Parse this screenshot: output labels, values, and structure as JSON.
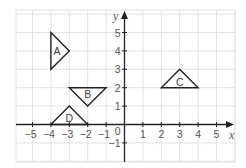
{
  "diagram": {
    "type": "coordinate-grid",
    "x_axis": {
      "label": "x",
      "min": -5,
      "max": 5,
      "ticks": [
        "−5",
        "−4",
        "−3",
        "−2",
        "−1",
        "1",
        "2",
        "3",
        "4",
        "5"
      ]
    },
    "y_axis": {
      "label": "y",
      "min": -1,
      "max": 5,
      "ticks": [
        "5",
        "4",
        "3",
        "2",
        "1",
        "−1"
      ]
    },
    "origin_label": "0",
    "shapes": [
      {
        "name": "A",
        "vertices": [
          [
            -4,
            5
          ],
          [
            -4,
            3
          ],
          [
            -3,
            4
          ]
        ]
      },
      {
        "name": "B",
        "vertices": [
          [
            -3,
            2
          ],
          [
            -1,
            2
          ],
          [
            -2,
            1
          ]
        ]
      },
      {
        "name": "C",
        "vertices": [
          [
            2,
            2
          ],
          [
            4,
            2
          ],
          [
            3,
            3
          ]
        ]
      },
      {
        "name": "D",
        "vertices": [
          [
            -4,
            0
          ],
          [
            -2,
            0
          ],
          [
            -3,
            1
          ]
        ]
      }
    ],
    "colors": {
      "grid": "#e2e2e2",
      "axis": "#222222",
      "labels": "#555555"
    }
  }
}
